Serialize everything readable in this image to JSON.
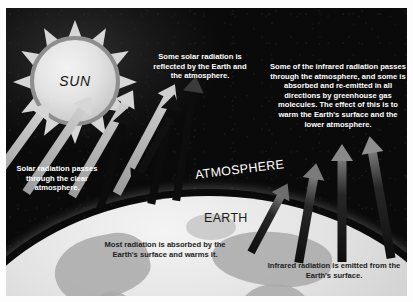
{
  "diagram": {
    "background_color": "#080808",
    "earth_color": "#e3e3e3",
    "sun_color": "#e2e2e2",
    "text_color": "#ffffff",
    "dark_text_color": "#1d1d1d"
  },
  "labels": {
    "sun": "SUN",
    "atmosphere": "ATMOSPHERE",
    "earth": "EARTH"
  },
  "annotations": {
    "reflected": "Some solar radiation is reflected by the Earth and the atmosphere.",
    "infrared": "Some of the infrared radiation passes through the atmosphere, and some is absorbed and re-emitted in all directions by greenhouse gas molecules. The effect of this is to warm the Earth's surface and the lower atmosphere.",
    "solar_incoming": "Solar radiation passes through the clear atmosphere.",
    "absorbed": "Most radiation is absorbed by the Earth's surface and warms it.",
    "emitted": "Infrared radiation is emitted from the Earth's surface."
  },
  "arrows": {
    "incoming_solar_count": 4,
    "reflected_count": 3,
    "emitted_infrared_count": 4,
    "absorbed_count": 1,
    "incoming_color": "#b9b9b9",
    "reflected_color": "#0d0d0d",
    "emitted_color": "#121212",
    "emitted_head_color": "#8a8a8a"
  }
}
